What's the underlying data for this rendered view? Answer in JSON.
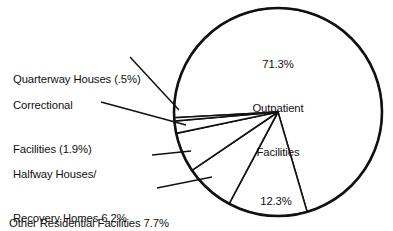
{
  "chart_data": {
    "type": "pie",
    "title": "",
    "subtitle": "",
    "xlabel": "",
    "ylabel": "",
    "legend_position": "none",
    "grid": false,
    "units": "percent",
    "categories": [
      "Outpatient Facilities",
      "Hospitals",
      "Other Residential Facilities",
      "Halfway Houses/Recovery Homes",
      "Correctional Facilities",
      "Quarterway Houses"
    ],
    "values": [
      71.3,
      12.3,
      7.7,
      6.2,
      1.9,
      0.5
    ],
    "slices": [
      {
        "name": "Outpatient Facilities",
        "value": 71.3,
        "label_text": "71.3%\nOutpatient\nFacilities",
        "label_placement": "inside",
        "fill": "#ffffff",
        "stroke": "#111111"
      },
      {
        "name": "Hospitals",
        "value": 12.3,
        "label_text": "12.3%\nHospitals",
        "label_placement": "inside",
        "fill": "#ffffff",
        "stroke": "#111111"
      },
      {
        "name": "Other Residential Facilities",
        "value": 7.7,
        "label_text": "Other Residential Facilities 7.7%",
        "label_placement": "outside-left",
        "fill": "#ffffff",
        "stroke": "#111111"
      },
      {
        "name": "Halfway Houses/Recovery Homes",
        "value": 6.2,
        "label_text": "Halfway Houses/\nRecovery Homes 6.2%",
        "label_placement": "outside-left",
        "fill": "#ffffff",
        "stroke": "#111111"
      },
      {
        "name": "Correctional Facilities",
        "value": 1.9,
        "label_text": "Correctional\nFacilities (1.9%)",
        "label_placement": "outside-left",
        "fill": "#ffffff",
        "stroke": "#111111"
      },
      {
        "name": "Quarterway Houses",
        "value": 0.5,
        "label_text": "Quarterway Houses (.5%)",
        "label_placement": "outside-left",
        "fill": "#ffffff",
        "stroke": "#111111"
      }
    ]
  },
  "labels": {
    "outpatient_line1": "71.3%",
    "outpatient_line2": "Outpatient",
    "outpatient_line3": "Facilities",
    "hospitals_line1": "12.3%",
    "hospitals_line2": "Hospitals",
    "quarterway": "Quarterway Houses (.5%)",
    "correctional_line1": "Correctional",
    "correctional_line2": "Facilities (1.9%)",
    "halfway_line1": "Halfway Houses/",
    "halfway_line2": "Recovery Homes 6.2%",
    "other_residential": "Other Residential Facilities 7.7%"
  },
  "style": {
    "background": "#ffffff",
    "line_color": "#111111",
    "text_color": "#111111"
  }
}
